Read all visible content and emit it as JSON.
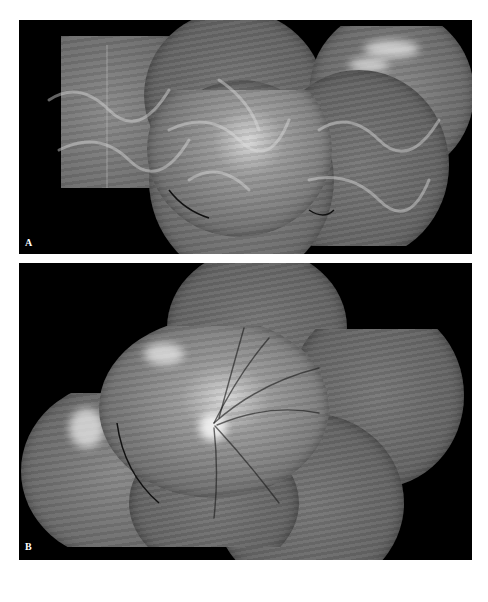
{
  "figure": {
    "panels": [
      {
        "id": "A",
        "label": "A",
        "description": "Wide-field fluorescein angiography montage (late phase) showing diffuse hyperfluorescent vascular network"
      },
      {
        "id": "B",
        "label": "B",
        "description": "Wide-field fundus montage centered on the optic disc with retinal vessels and hyperfluorescent patches"
      }
    ]
  },
  "colors": {
    "panel_background": "#000000",
    "page_background": "#ffffff",
    "label_color": "#ffffff"
  }
}
